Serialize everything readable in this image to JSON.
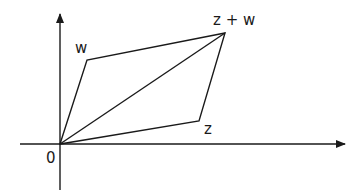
{
  "diagram": {
    "labels": {
      "origin": "0",
      "w": "w",
      "z": "z",
      "sum": "z + w"
    },
    "points": {
      "origin": [
        60,
        144
      ],
      "w": [
        87,
        60
      ],
      "z": [
        199,
        121
      ],
      "sum": [
        225,
        33
      ]
    },
    "colors": {
      "stroke": "#1a1a1a",
      "background": "#ffffff"
    }
  }
}
